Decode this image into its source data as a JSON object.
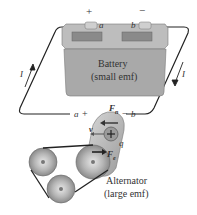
{
  "diagram": {
    "battery": {
      "label_line1": "Battery",
      "label_line2": "(small emf)",
      "plus_sign": "+",
      "minus_sign": "−",
      "terminal_a": "a",
      "terminal_b": "b",
      "body_color": "#a9a9a9",
      "top_color": "#bdbdbd"
    },
    "current": {
      "left_label": "I",
      "right_label": "I"
    },
    "alternator": {
      "label_line1": "Alternator",
      "label_line2": "(large emf)",
      "terminal_a": "a",
      "plus_sign": "+",
      "minus_sign": "−",
      "terminal_b": "b",
      "force_n": "F",
      "force_n_sub": "n",
      "force_e": "F",
      "force_e_sub": "e",
      "velocity": "v",
      "charge": "q",
      "charge_sign": "+"
    },
    "wire_color": "#222222"
  }
}
